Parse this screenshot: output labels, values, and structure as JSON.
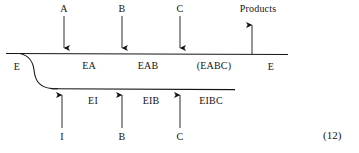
{
  "figure": {
    "equation_number": "(12)",
    "top_chain": {
      "inlet_label": "E",
      "outlet_label": "E",
      "segments": [
        {
          "label": "EA"
        },
        {
          "label": "EAB"
        },
        {
          "label": "(EABC)"
        }
      ],
      "arrows": [
        {
          "label": "A",
          "direction": "down"
        },
        {
          "label": "B",
          "direction": "down"
        },
        {
          "label": "C",
          "direction": "down"
        },
        {
          "label": "Products",
          "direction": "up"
        }
      ]
    },
    "bottom_chain": {
      "segments": [
        {
          "label": "EI"
        },
        {
          "label": "EIB"
        },
        {
          "label": "EIBC"
        }
      ],
      "arrows": [
        {
          "label": "I",
          "direction": "up"
        },
        {
          "label": "B",
          "direction": "up"
        },
        {
          "label": "C",
          "direction": "up"
        }
      ]
    },
    "colors": {
      "ink": "#141414",
      "background": "#ffffff"
    }
  }
}
